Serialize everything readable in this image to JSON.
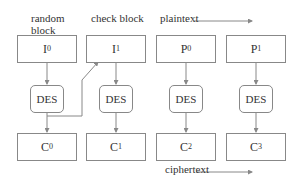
{
  "labels": {
    "random_block_line1": "random",
    "random_block_line2": "block",
    "check_block": "check block",
    "plaintext": "plaintext",
    "ciphertext": "ciphertext"
  },
  "inputs": [
    {
      "letter": "I",
      "sub": "0"
    },
    {
      "letter": "I",
      "sub": "1"
    },
    {
      "letter": "P",
      "sub": "0"
    },
    {
      "letter": "P",
      "sub": "1"
    }
  ],
  "des": [
    "DES",
    "DES",
    "DES",
    "DES"
  ],
  "outputs": [
    {
      "letter": "C",
      "sub": "0"
    },
    {
      "letter": "C",
      "sub": "1"
    },
    {
      "letter": "C",
      "sub": "2"
    },
    {
      "letter": "C",
      "sub": "3"
    }
  ]
}
